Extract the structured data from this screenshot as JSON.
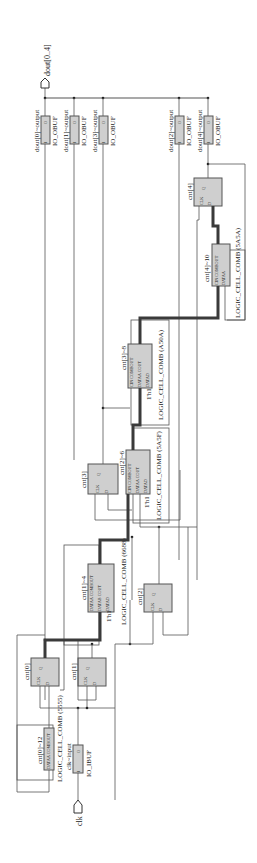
{
  "ports": {
    "output_bus": "dout[0..4]",
    "clock_input": "clk"
  },
  "output_buffers": [
    {
      "instance": "dout[0]~output",
      "type": "IO_OBUF",
      "pin_in": "I",
      "pin_out": "O"
    },
    {
      "instance": "dout[1]~output",
      "type": "IO_OBUF",
      "pin_in": "I",
      "pin_out": "O"
    },
    {
      "instance": "dout[3]~output",
      "type": "IO_OBUF",
      "pin_in": "I",
      "pin_out": "O"
    },
    {
      "instance": "dout[2]~output",
      "type": "IO_OBUF",
      "pin_in": "I",
      "pin_out": "O"
    },
    {
      "instance": "dout[4]~output",
      "type": "IO_OBUF",
      "pin_in": "I",
      "pin_out": "O"
    }
  ],
  "input_buffer": {
    "instance": "clk~input",
    "type": "IO_IBUF",
    "pin_in": "I",
    "pin_out": "O"
  },
  "registers": [
    {
      "instance": "cnt[0]",
      "clk": "CLK",
      "d": "D",
      "q": "Q"
    },
    {
      "instance": "cnt[1]",
      "clk": "CLK",
      "d": "D",
      "q": "Q"
    },
    {
      "instance": "cnt[2]",
      "clk": "CLK",
      "d": "D",
      "q": "Q"
    },
    {
      "instance": "cnt[3]",
      "clk": "CLK",
      "d": "D",
      "q": "Q"
    },
    {
      "instance": "cnt[4]",
      "clk": "CLK",
      "d": "D",
      "q": "Q"
    }
  ],
  "logic_cells": [
    {
      "instance": "cnt[0]~12",
      "type": "LOGIC_CELL_COMB (5555)",
      "pins": [
        "DATAA",
        "COMBOUT"
      ]
    },
    {
      "instance": "cnt[1]~4",
      "type": "LOGIC_CELL_COMB (6688)",
      "pins": [
        "DATAA",
        "DATAB",
        "DATAD",
        "COMBOUT",
        "COUT"
      ],
      "const": "1'h1"
    },
    {
      "instance": "cnt[2]~6",
      "type": "LOGIC_CELL_COMB (5A5F)",
      "pins": [
        "CIN",
        "DATAA",
        "DATAD",
        "COMBOUT",
        "COUT"
      ],
      "const": "1'h1"
    },
    {
      "instance": "cnt[3]~8",
      "type": "LOGIC_CELL_COMB (A50A)",
      "pins": [
        "CIN",
        "DATAA",
        "DATAD",
        "COMBOUT",
        "COUT"
      ],
      "const": "1'h1"
    },
    {
      "instance": "cnt[4]~10",
      "type": "LOGIC_CELL_COMB (5A5A)",
      "pins": [
        "CIN",
        "DATAA",
        "COMBOUT"
      ]
    }
  ]
}
